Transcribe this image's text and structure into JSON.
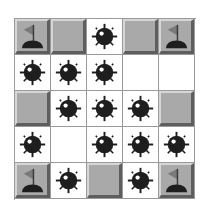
{
  "game": {
    "rows": 5,
    "cols": 5,
    "colors": {
      "tile": "#a9a9a9",
      "tile_highlight": "#d6d6d6",
      "tile_shadow": "#5e5e5e",
      "grid_line": "#9a9a9a",
      "bomb": "#1e1e1e",
      "flag": "#7a7a7a",
      "open_cell": "#ffffff"
    },
    "legend": {
      "tile": "unrevealed tile",
      "flag": "flagged tile",
      "bomb": "revealed mine",
      "empty": "revealed empty cell"
    },
    "cells": [
      [
        "flag",
        "tile",
        "bomb",
        "tile",
        "flag"
      ],
      [
        "bomb",
        "bomb",
        "bomb",
        "empty",
        "empty"
      ],
      [
        "tile",
        "bomb",
        "bomb",
        "bomb",
        "tile"
      ],
      [
        "bomb",
        "empty",
        "bomb",
        "bomb",
        "bomb"
      ],
      [
        "flag",
        "bomb",
        "tile",
        "bomb",
        "flag"
      ]
    ]
  }
}
